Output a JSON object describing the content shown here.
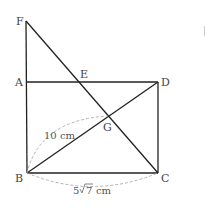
{
  "points": {
    "F": {
      "label": "F",
      "x": 26,
      "y": 21
    },
    "A": {
      "label": "A",
      "x": 26,
      "y": 82
    },
    "E": {
      "label": "E",
      "x": 79,
      "y": 82
    },
    "D": {
      "label": "D",
      "x": 158,
      "y": 82
    },
    "G": {
      "label": "G",
      "x": 108,
      "y": 116
    },
    "B": {
      "label": "B",
      "x": 27,
      "y": 173
    },
    "C": {
      "label": "C",
      "x": 158,
      "y": 173
    }
  },
  "segments": [
    "F-A",
    "A-B",
    "A-D",
    "D-C",
    "B-C",
    "B-D",
    "F-C"
  ],
  "measurements": {
    "BG": "10 cm",
    "BC_coef": "5",
    "BC_rad": "7",
    "BC_unit": "cm"
  }
}
